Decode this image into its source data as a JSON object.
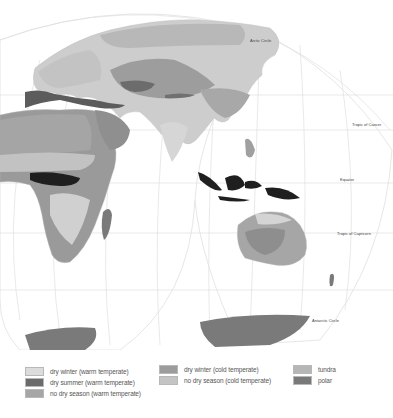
{
  "map": {
    "labels": {
      "arctic_circle": "Arctic Circle",
      "tropic_cancer": "Tropic of Cancer",
      "equator": "Equator",
      "tropic_capricorn": "Tropic of Capricorn",
      "antarctic_circle": "Antarctic Circle"
    },
    "colors": {
      "ocean": "#ffffff",
      "graticule": "#d9d9d9",
      "land_base": "#e6e6e6",
      "dry_winter_warm": "#d8d8d8",
      "dry_summer_warm": "#6a6a6a",
      "no_dry_season_warm": "#a9a9a9",
      "dry_winter_cold": "#9a9a9a",
      "no_dry_season_cold": "#c2c2c2",
      "tundra": "#b3b3b3",
      "polar": "#7a7a7a",
      "tropical_wet": "#1e1e1e"
    }
  },
  "legend": {
    "columns": [
      [
        {
          "label": "dry winter (warm temperate)",
          "color": "#dcdcdc"
        },
        {
          "label": "dry summer (warm temperate)",
          "color": "#6b6b6b"
        },
        {
          "label": "no dry season (warm temperate)",
          "color": "#a6a6a6"
        }
      ],
      [
        {
          "label": "dry winter (cold temperate)",
          "color": "#9c9c9c"
        },
        {
          "label": "no dry season (cold temperate)",
          "color": "#c4c4c4"
        }
      ],
      [
        {
          "label": "tundra",
          "color": "#b6b6b6"
        },
        {
          "label": "polar",
          "color": "#797979"
        }
      ]
    ]
  }
}
